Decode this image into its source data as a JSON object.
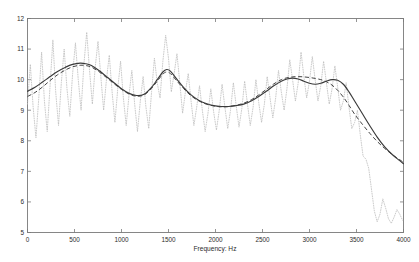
{
  "chart_data": {
    "type": "line",
    "title": "",
    "xlabel": "Frequency: Hz",
    "ylabel": "",
    "xlim": [
      0,
      4000
    ],
    "ylim": [
      5,
      12
    ],
    "grid": false,
    "legend": "none",
    "xticks": [
      0,
      500,
      1000,
      1500,
      2000,
      2500,
      3000,
      3500,
      4000
    ],
    "xtick_labels": [
      "0",
      "500",
      "1000",
      "1500",
      "2000",
      "2500",
      "3000",
      "3500",
      "4000"
    ],
    "yticks": [
      5,
      6,
      7,
      8,
      9,
      10,
      11,
      12
    ],
    "ytick_labels": [
      "5",
      "6",
      "7",
      "8",
      "9",
      "10",
      "11",
      "12"
    ],
    "series": [
      {
        "name": "smoothed-envelope-solid",
        "style": "solid",
        "color": "#3a3a3a",
        "x": [
          0,
          80,
          160,
          240,
          320,
          400,
          480,
          560,
          620,
          680,
          760,
          840,
          920,
          1000,
          1080,
          1160,
          1240,
          1320,
          1380,
          1440,
          1480,
          1520,
          1580,
          1660,
          1740,
          1820,
          1900,
          1980,
          2060,
          2140,
          2220,
          2300,
          2380,
          2460,
          2540,
          2620,
          2700,
          2760,
          2820,
          2880,
          2940,
          3000,
          3060,
          3120,
          3180,
          3240,
          3300,
          3360,
          3420,
          3480,
          3560,
          3640,
          3720,
          3800,
          3880,
          3960,
          4000
        ],
        "y": [
          9.62,
          9.75,
          9.92,
          10.1,
          10.27,
          10.4,
          10.5,
          10.54,
          10.52,
          10.46,
          10.3,
          10.1,
          9.9,
          9.7,
          9.55,
          9.48,
          9.52,
          9.75,
          10.0,
          10.25,
          10.33,
          10.28,
          10.05,
          9.75,
          9.5,
          9.33,
          9.22,
          9.15,
          9.12,
          9.12,
          9.15,
          9.2,
          9.3,
          9.45,
          9.62,
          9.8,
          9.95,
          10.02,
          10.05,
          10.02,
          9.95,
          9.88,
          9.85,
          9.88,
          9.95,
          10.0,
          9.98,
          9.85,
          9.6,
          9.3,
          8.9,
          8.5,
          8.12,
          7.8,
          7.55,
          7.35,
          7.25
        ]
      },
      {
        "name": "model-envelope-dashed",
        "style": "dashed",
        "color": "#444444",
        "x": [
          0,
          80,
          160,
          240,
          320,
          400,
          480,
          560,
          620,
          680,
          760,
          840,
          920,
          1000,
          1080,
          1160,
          1240,
          1320,
          1380,
          1440,
          1480,
          1520,
          1580,
          1660,
          1740,
          1820,
          1900,
          1980,
          2060,
          2140,
          2220,
          2300,
          2380,
          2460,
          2540,
          2620,
          2700,
          2760,
          2820,
          2880,
          2940,
          3000,
          3060,
          3120,
          3180,
          3240,
          3300,
          3360,
          3420,
          3480,
          3560,
          3640,
          3720,
          3800,
          3880,
          3960,
          4000
        ],
        "y": [
          9.45,
          9.58,
          9.76,
          9.97,
          10.16,
          10.31,
          10.42,
          10.47,
          10.46,
          10.41,
          10.26,
          10.07,
          9.87,
          9.68,
          9.53,
          9.46,
          9.5,
          9.72,
          9.95,
          10.18,
          10.25,
          10.2,
          9.99,
          9.71,
          9.47,
          9.31,
          9.2,
          9.14,
          9.11,
          9.12,
          9.16,
          9.23,
          9.34,
          9.5,
          9.68,
          9.86,
          10.0,
          10.06,
          10.09,
          10.1,
          10.09,
          10.07,
          10.04,
          10.0,
          9.93,
          9.82,
          9.65,
          9.43,
          9.16,
          8.87,
          8.55,
          8.25,
          7.98,
          7.75,
          7.55,
          7.38,
          7.3
        ]
      },
      {
        "name": "raw-spectrum-dotted",
        "style": "dotted",
        "color": "#b9b9b9",
        "x": [
          0,
          30,
          60,
          90,
          120,
          150,
          180,
          210,
          240,
          270,
          300,
          330,
          360,
          390,
          420,
          450,
          480,
          510,
          540,
          570,
          600,
          630,
          660,
          690,
          720,
          750,
          780,
          810,
          840,
          870,
          900,
          930,
          960,
          990,
          1020,
          1050,
          1080,
          1110,
          1140,
          1170,
          1200,
          1230,
          1260,
          1290,
          1320,
          1350,
          1380,
          1410,
          1440,
          1470,
          1500,
          1530,
          1560,
          1590,
          1620,
          1650,
          1680,
          1710,
          1740,
          1770,
          1800,
          1830,
          1860,
          1890,
          1920,
          1950,
          1980,
          2010,
          2040,
          2070,
          2100,
          2130,
          2160,
          2190,
          2220,
          2250,
          2280,
          2310,
          2340,
          2370,
          2400,
          2430,
          2460,
          2490,
          2520,
          2550,
          2580,
          2610,
          2640,
          2670,
          2700,
          2730,
          2760,
          2790,
          2820,
          2850,
          2880,
          2910,
          2940,
          2970,
          3000,
          3030,
          3060,
          3090,
          3120,
          3150,
          3180,
          3210,
          3240,
          3270,
          3300,
          3330,
          3360,
          3390,
          3420,
          3450,
          3480,
          3510,
          3540,
          3570,
          3600,
          3630,
          3660,
          3690,
          3720,
          3750,
          3780,
          3810,
          3840,
          3870,
          3900,
          3930,
          3960,
          3990
        ],
        "y": [
          9.2,
          10.5,
          9.1,
          8.1,
          9.4,
          10.9,
          9.3,
          8.3,
          9.8,
          11.3,
          9.6,
          8.5,
          9.9,
          11.0,
          9.7,
          8.8,
          10.2,
          11.2,
          10.0,
          9.0,
          10.5,
          11.55,
          10.3,
          9.2,
          10.4,
          11.25,
          10.1,
          9.0,
          10.0,
          10.8,
          9.6,
          8.6,
          9.7,
          10.6,
          9.4,
          8.5,
          9.5,
          10.3,
          9.2,
          8.3,
          9.3,
          10.1,
          9.1,
          8.4,
          9.6,
          10.7,
          9.9,
          9.4,
          10.6,
          11.45,
          10.7,
          9.6,
          10.2,
          10.85,
          9.9,
          8.9,
          9.6,
          10.2,
          9.3,
          8.5,
          9.1,
          9.8,
          9.0,
          8.3,
          8.9,
          9.7,
          8.95,
          8.35,
          9.0,
          9.85,
          9.1,
          8.4,
          9.0,
          9.9,
          9.15,
          8.45,
          9.05,
          9.95,
          9.2,
          8.5,
          9.1,
          10.0,
          9.25,
          8.6,
          9.2,
          10.1,
          9.4,
          8.75,
          9.4,
          10.3,
          9.6,
          9.0,
          9.7,
          10.65,
          10.0,
          9.3,
          9.9,
          10.9,
          10.1,
          9.4,
          9.95,
          10.75,
          10.0,
          9.3,
          9.8,
          10.6,
          9.9,
          9.2,
          9.7,
          10.45,
          9.75,
          9.0,
          9.3,
          9.9,
          9.1,
          8.4,
          8.6,
          9.0,
          8.2,
          7.5,
          7.4,
          7.1,
          6.4,
          5.7,
          5.35,
          5.6,
          6.1,
          5.8,
          5.45,
          5.3,
          5.5,
          5.75,
          5.6,
          5.4
        ]
      }
    ]
  }
}
